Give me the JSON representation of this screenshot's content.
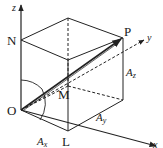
{
  "diagram": {
    "type": "3d-vector-decomposition",
    "axes": {
      "z": {
        "label": "z"
      },
      "y": {
        "label": "y"
      },
      "x": {
        "label": "x"
      }
    },
    "points": {
      "origin": {
        "label": "O"
      },
      "N": {
        "label": "N"
      },
      "P": {
        "label": "P"
      },
      "M": {
        "label": "M"
      },
      "L": {
        "label": "L"
      }
    },
    "components": {
      "Ax": {
        "base": "A",
        "sub": "x"
      },
      "Ay": {
        "base": "A",
        "sub": "y"
      },
      "Az": {
        "base": "A",
        "sub": "z"
      }
    },
    "colors": {
      "line": "#222222",
      "background": "#ffffff"
    }
  }
}
